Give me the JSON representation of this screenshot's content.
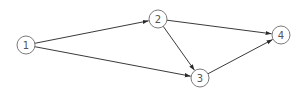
{
  "diagram": {
    "type": "directed-graph",
    "nodes": [
      {
        "id": "1",
        "label": "1",
        "x": 26,
        "y": 45
      },
      {
        "id": "2",
        "label": "2",
        "x": 158,
        "y": 19
      },
      {
        "id": "3",
        "label": "3",
        "x": 200,
        "y": 78
      },
      {
        "id": "4",
        "label": "4",
        "x": 281,
        "y": 35
      }
    ],
    "edges": [
      {
        "from": "1",
        "to": "2"
      },
      {
        "from": "1",
        "to": "3"
      },
      {
        "from": "2",
        "to": "3"
      },
      {
        "from": "2",
        "to": "4"
      },
      {
        "from": "3",
        "to": "4"
      }
    ],
    "node_radius": 9,
    "colors": {
      "edge": "#3a3a3a",
      "node_stroke": "#7a7a7a",
      "label": "#555555",
      "background": "#ffffff"
    }
  }
}
